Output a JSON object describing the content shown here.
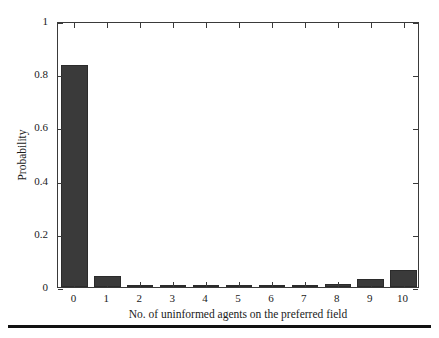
{
  "chart_data": {
    "type": "bar",
    "title": "",
    "xlabel": "No. of uninformed agents on the preferred field",
    "ylabel": "Probability",
    "categories": [
      "0",
      "1",
      "2",
      "3",
      "4",
      "5",
      "6",
      "7",
      "8",
      "9",
      "10"
    ],
    "values": [
      0.835,
      0.042,
      0.003,
      0.002,
      0.002,
      0.003,
      0.003,
      0.006,
      0.013,
      0.03,
      0.064
    ],
    "xlim": [
      -0.5,
      10.5
    ],
    "ylim": [
      0,
      1
    ],
    "ytick_labels": [
      "0",
      "0.2",
      "0.4",
      "0.6",
      "0.8",
      "1"
    ],
    "ytick_values": [
      0,
      0.2,
      0.4,
      0.6,
      0.8,
      1
    ],
    "xtick_labels": [
      "0",
      "1",
      "2",
      "3",
      "4",
      "5",
      "6",
      "7",
      "8",
      "9",
      "10"
    ],
    "grid": false,
    "legend": null,
    "bar_color": "#3a3a3a",
    "axis_color": "#3a3a3a",
    "background": "#ffffff",
    "bar_width_fraction": 0.8
  },
  "figure": {
    "rule_color": "#111111"
  }
}
